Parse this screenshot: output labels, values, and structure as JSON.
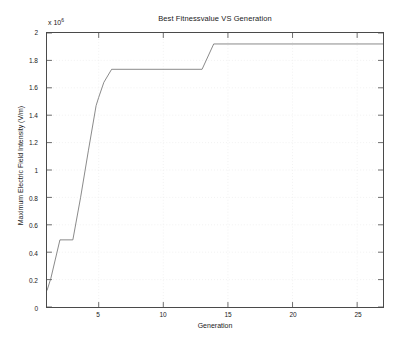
{
  "chart_data": {
    "type": "line",
    "title": "Best Fitnessvalue VS Generation",
    "xlabel": "Generation",
    "ylabel": "Maximum Electric Field Intensity (V/m)",
    "y_exponent_prefix": "x 10",
    "y_exponent_value": "6",
    "y_scale_factor": 1000000,
    "xlim": [
      1,
      27
    ],
    "ylim": [
      0,
      2
    ],
    "xticks": [
      5,
      10,
      15,
      20,
      25
    ],
    "xtick_labels": [
      "5",
      "10",
      "15",
      "20",
      "25"
    ],
    "yticks": [
      0,
      0.2,
      0.4,
      0.6,
      0.8,
      1,
      1.2,
      1.4,
      1.6,
      1.8,
      2
    ],
    "ytick_labels": [
      "0",
      "0.2",
      "0.4",
      "0.6",
      "0.8",
      "1",
      "1.2",
      "1.4",
      "1.6",
      "1.8",
      "2"
    ],
    "grid": true,
    "grid_style": "dotted",
    "legend": null,
    "line_color": "#6b6b6b",
    "line_width": 0.8,
    "series": [
      {
        "name": "Best Fitness Value",
        "x": [
          1,
          1.3,
          2,
          3,
          3.6,
          4.2,
          4.8,
          5.0,
          5.4,
          6.0,
          13.0,
          13.9,
          27
        ],
        "values": [
          0.12,
          0.21,
          0.49,
          0.49,
          0.8,
          1.14,
          1.47,
          1.53,
          1.64,
          1.735,
          1.735,
          1.92,
          1.92
        ]
      }
    ]
  }
}
